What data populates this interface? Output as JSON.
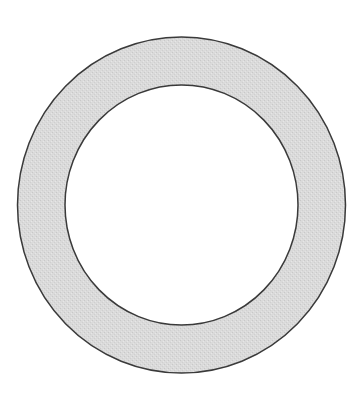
{
  "diagram": {
    "type": "annulus",
    "canvas": {
      "width": 360,
      "height": 406,
      "background": "#ffffff"
    },
    "center": {
      "x": 181.5,
      "y": 205
    },
    "outer_circle": {
      "rx": 164,
      "ry": 168,
      "stroke": "#3a3a3a",
      "stroke_width": 1.5
    },
    "inner_circle": {
      "rx": 116.5,
      "ry": 120,
      "stroke": "#3a3a3a",
      "stroke_width": 1.5,
      "fill": "#ffffff"
    },
    "band": {
      "fill": "#d9d9d9",
      "texture": "stippled"
    }
  }
}
